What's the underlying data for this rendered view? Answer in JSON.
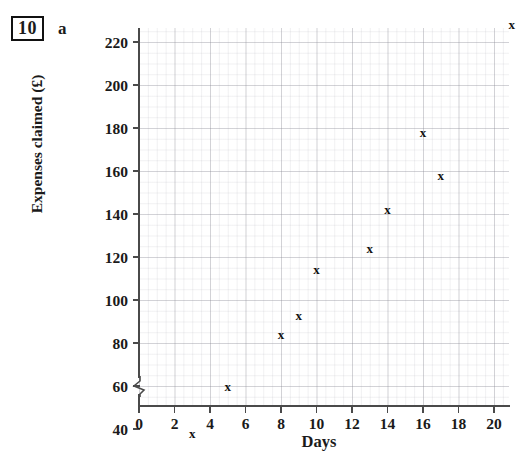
{
  "question": {
    "number": "10",
    "part": "a"
  },
  "chart_data": {
    "type": "scatter",
    "title": "",
    "xlabel": "Days",
    "ylabel": "Expenses claimed (£)",
    "grid": true,
    "legend_position": "none",
    "xlim": [
      0,
      21
    ],
    "ylim": [
      30,
      232
    ],
    "y_axis_break": true,
    "y_axis_break_icon": "axis-break-zigzag-icon",
    "marker": "x",
    "xticks": [
      "0",
      "2",
      "4",
      "6",
      "8",
      "10",
      "12",
      "14",
      "16",
      "18",
      "20"
    ],
    "xtick_values": [
      0,
      2,
      4,
      6,
      8,
      10,
      12,
      14,
      16,
      18,
      20
    ],
    "yticks": [
      "40",
      "60",
      "80",
      "100",
      "120",
      "140",
      "160",
      "180",
      "200",
      "220"
    ],
    "ytick_values": [
      40,
      60,
      80,
      100,
      120,
      140,
      160,
      180,
      200,
      220
    ],
    "x": [
      3,
      5,
      8,
      9,
      10,
      13,
      14,
      16,
      17,
      21
    ],
    "y": [
      38,
      60,
      84,
      93,
      114,
      124,
      142,
      178,
      158,
      228
    ],
    "points": [
      {
        "x": 3,
        "y": 38
      },
      {
        "x": 5,
        "y": 60
      },
      {
        "x": 8,
        "y": 84
      },
      {
        "x": 9,
        "y": 93
      },
      {
        "x": 10,
        "y": 114
      },
      {
        "x": 13,
        "y": 124
      },
      {
        "x": 14,
        "y": 142
      },
      {
        "x": 16,
        "y": 178
      },
      {
        "x": 17,
        "y": 158
      },
      {
        "x": 21,
        "y": 228
      }
    ]
  },
  "colors": {
    "axis": "#4a4a4a",
    "marker": "#111111",
    "grid": "#8c8c96",
    "text": "#1a1a1a",
    "background": "#ffffff"
  }
}
